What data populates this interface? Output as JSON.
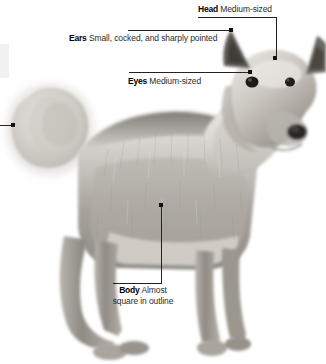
{
  "figure": {
    "background_color": "#ffffff",
    "line_color": "#222222",
    "text_color": "#1a1a1a"
  },
  "callouts": [
    {
      "id": "head",
      "term": "Head",
      "description": "Medium-sized",
      "label_left": 198,
      "label_top": 4,
      "leader": {
        "h_left": 198,
        "h_top": 17,
        "h_width": 79,
        "v_left": 276,
        "v_top": 17,
        "v_height": 42,
        "dot_left": 273,
        "dot_top": 56
      }
    },
    {
      "id": "ears",
      "term": "Ears",
      "description": "Small, cocked, and sharply pointed",
      "label_left": 69,
      "label_top": 33,
      "leader": {
        "h_left": 128,
        "h_top": 30,
        "h_width": 104,
        "dot_left": 229,
        "dot_top": 28
      }
    },
    {
      "id": "eyes",
      "term": "Eyes",
      "description": "Medium-sized",
      "label_left": 128,
      "label_top": 76,
      "leader": {
        "h_left": 129,
        "h_top": 72,
        "h_width": 122,
        "dot_left": 248,
        "dot_top": 70
      }
    },
    {
      "id": "body",
      "term": "Body",
      "description": "Almost",
      "description_line2": "square in outline",
      "label_left": 88,
      "label_top": 285,
      "leader": {
        "h_left": 113,
        "h_top": 283,
        "h_width": 49,
        "v_left": 161,
        "v_top": 206,
        "v_height": 78,
        "dot_left": 159,
        "dot_top": 203
      }
    },
    {
      "id": "tail",
      "term": "",
      "description": "",
      "leader": {
        "h_left": 0,
        "h_top": 125,
        "h_width": 13,
        "dot_left": 11,
        "dot_top": 123
      }
    }
  ]
}
